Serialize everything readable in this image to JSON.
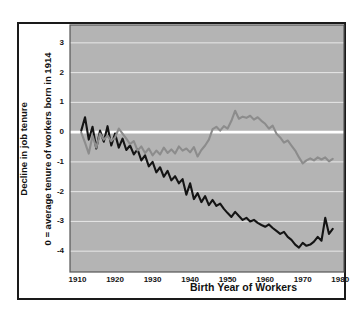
{
  "chart_data": {
    "type": "line",
    "title": "",
    "xlabel": "Birth Year of Workers",
    "ylabel_line1": "Decline in job tenure",
    "ylabel_line2": "0 = average tenure of workers born in 1914",
    "xlim": [
      1908,
      1981
    ],
    "ylim": [
      -4.7,
      3.6
    ],
    "xticks": [
      1910,
      1920,
      1930,
      1940,
      1950,
      1960,
      1970,
      1980
    ],
    "xtick_labels": [
      "1910",
      "1920",
      "1930",
      "1940",
      "1950",
      "1960",
      "1970",
      "1980"
    ],
    "yticks": [
      3,
      2,
      1,
      0,
      -1,
      -2,
      -3,
      -4
    ],
    "ytick_labels": [
      "3",
      "2",
      "1",
      "0",
      "-1",
      "-2",
      "-3",
      "-4"
    ],
    "grid": true,
    "grid_color": "#e8e8e8",
    "zero_line_color": "#ffffff",
    "plot_background": "#b4b4b4",
    "legend": "none",
    "series": [
      {
        "name": "black-series",
        "color": "#141414",
        "x": [
          1911,
          1912,
          1913,
          1914,
          1915,
          1916,
          1917,
          1918,
          1919,
          1920,
          1921,
          1922,
          1923,
          1924,
          1925,
          1926,
          1927,
          1928,
          1929,
          1930,
          1931,
          1932,
          1933,
          1934,
          1935,
          1936,
          1937,
          1938,
          1939,
          1940,
          1941,
          1942,
          1943,
          1944,
          1945,
          1946,
          1947,
          1948,
          1949,
          1950,
          1951,
          1952,
          1953,
          1954,
          1955,
          1956,
          1957,
          1958,
          1959,
          1960,
          1961,
          1962,
          1963,
          1964,
          1965,
          1966,
          1967,
          1968,
          1969,
          1970,
          1971,
          1972,
          1973,
          1974,
          1975,
          1976,
          1977,
          1978
        ],
        "values": [
          0.05,
          0.5,
          -0.25,
          0.18,
          -0.55,
          0.05,
          -0.32,
          0.2,
          -0.45,
          -0.05,
          -0.52,
          -0.22,
          -0.6,
          -0.45,
          -0.75,
          -0.58,
          -0.95,
          -0.78,
          -1.15,
          -1.0,
          -1.35,
          -1.18,
          -1.5,
          -1.3,
          -1.62,
          -1.48,
          -1.72,
          -1.58,
          -2.1,
          -1.72,
          -2.25,
          -2.05,
          -2.35,
          -2.15,
          -2.45,
          -2.28,
          -2.48,
          -2.4,
          -2.58,
          -2.72,
          -2.85,
          -2.68,
          -2.82,
          -2.95,
          -2.88,
          -3.0,
          -2.95,
          -3.05,
          -3.12,
          -3.18,
          -3.1,
          -3.22,
          -3.32,
          -3.42,
          -3.35,
          -3.52,
          -3.62,
          -3.78,
          -3.88,
          -3.72,
          -3.82,
          -3.78,
          -3.68,
          -3.52,
          -3.65,
          -2.88,
          -3.42,
          -3.25
        ]
      },
      {
        "name": "gray-series",
        "color": "#8c8c8c",
        "x": [
          1911,
          1912,
          1913,
          1914,
          1915,
          1916,
          1917,
          1918,
          1919,
          1920,
          1921,
          1922,
          1923,
          1924,
          1925,
          1926,
          1927,
          1928,
          1929,
          1930,
          1931,
          1932,
          1933,
          1934,
          1935,
          1936,
          1937,
          1938,
          1939,
          1940,
          1941,
          1942,
          1943,
          1944,
          1945,
          1946,
          1947,
          1948,
          1949,
          1950,
          1951,
          1952,
          1953,
          1954,
          1955,
          1956,
          1957,
          1958,
          1959,
          1960,
          1961,
          1962,
          1963,
          1964,
          1965,
          1966,
          1967,
          1968,
          1969,
          1970,
          1971,
          1972,
          1973,
          1974,
          1975,
          1976,
          1977,
          1978
        ],
        "values": [
          -0.02,
          -0.35,
          -0.72,
          -0.12,
          -0.52,
          -0.05,
          -0.25,
          -0.12,
          -0.3,
          -0.18,
          0.12,
          -0.05,
          -0.22,
          -0.4,
          -0.3,
          -0.62,
          -0.48,
          -0.7,
          -0.55,
          -0.78,
          -0.62,
          -0.75,
          -0.52,
          -0.7,
          -0.58,
          -0.72,
          -0.48,
          -0.62,
          -0.55,
          -0.68,
          -0.5,
          -0.82,
          -0.6,
          -0.45,
          -0.25,
          0.1,
          0.18,
          0.05,
          0.2,
          0.12,
          0.38,
          0.72,
          0.45,
          0.52,
          0.48,
          0.55,
          0.42,
          0.5,
          0.38,
          0.28,
          0.12,
          0.22,
          -0.05,
          -0.18,
          -0.35,
          -0.28,
          -0.45,
          -0.62,
          -0.85,
          -1.05,
          -0.95,
          -0.88,
          -0.95,
          -0.85,
          -0.92,
          -0.85,
          -0.98,
          -0.9
        ]
      }
    ]
  }
}
